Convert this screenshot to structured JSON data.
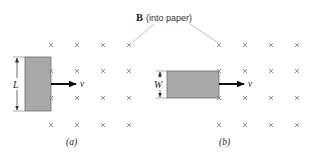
{
  "field_label": {
    "symbol": "B",
    "description": "(into paper)"
  },
  "panels": [
    {
      "id": "a",
      "caption": "(a)",
      "dimension_label": "L",
      "velocity_label": "v",
      "cross_columns_x": [
        51,
        77,
        103,
        129
      ],
      "cross_rows_y": [
        45,
        71,
        98,
        125
      ],
      "loop": {
        "x": 25,
        "y": 57,
        "width": 26,
        "height": 54
      }
    },
    {
      "id": "b",
      "caption": "(b)",
      "dimension_label": "W",
      "velocity_label": "v",
      "cross_columns_x": [
        219,
        245,
        271,
        297
      ],
      "cross_rows_y": [
        45,
        71,
        98,
        125
      ],
      "loop": {
        "x": 167,
        "y": 71,
        "width": 52,
        "height": 27
      }
    }
  ],
  "colors": {
    "loop_fill": "#a9a9a9",
    "loop_stroke": "#6e6e6e",
    "cross": "#8a8a8a",
    "arrow": "#111111",
    "text": "#222222",
    "leader_line": "#9a9a9a"
  }
}
